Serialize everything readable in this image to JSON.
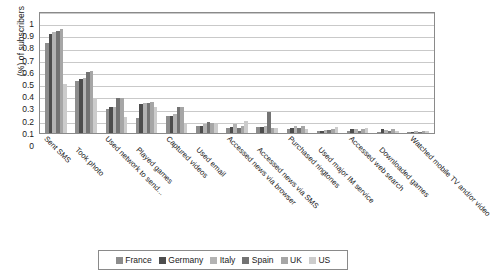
{
  "chart_data": {
    "type": "bar",
    "title": "",
    "xlabel": "",
    "ylabel": "(%) of subscribers",
    "ylim": [
      0,
      1
    ],
    "yticks": [
      "0",
      "0.1",
      "0.2",
      "0.3",
      "0.4",
      "0.5",
      "0.6",
      "0.7",
      "0.8",
      "0.9",
      "1"
    ],
    "grid": true,
    "legend_position": "bottom",
    "categories": [
      "Sent SMS",
      "Took photo",
      "Used network to send...",
      "Played games",
      "Captured videos",
      "Used email",
      "Accessed news via browser",
      "Accessed news via SMS",
      "Purchased ringtones",
      "Used major IM service",
      "Accessed web search",
      "Downloaded games",
      "Watched mobile TV and/or video"
    ],
    "series": [
      {
        "name": "France",
        "color": "#8c8c8c",
        "values": [
          0.74,
          0.43,
          0.2,
          0.12,
          0.14,
          0.06,
          0.04,
          0.05,
          0.035,
          0.015,
          0.02,
          0.01,
          0.005
        ]
      },
      {
        "name": "Germany",
        "color": "#4d4d4d",
        "values": [
          0.81,
          0.44,
          0.21,
          0.24,
          0.14,
          0.06,
          0.05,
          0.05,
          0.04,
          0.02,
          0.03,
          0.03,
          0.01
        ]
      },
      {
        "name": "Italy",
        "color": "#b3b3b3",
        "values": [
          0.83,
          0.45,
          0.21,
          0.25,
          0.155,
          0.07,
          0.07,
          0.055,
          0.055,
          0.025,
          0.035,
          0.025,
          0.015
        ]
      },
      {
        "name": "Spain",
        "color": "#737373",
        "values": [
          0.84,
          0.5,
          0.29,
          0.25,
          0.21,
          0.09,
          0.045,
          0.17,
          0.04,
          0.025,
          0.02,
          0.015,
          0.01
        ]
      },
      {
        "name": "UK",
        "color": "#a6a6a6",
        "values": [
          0.855,
          0.51,
          0.285,
          0.255,
          0.215,
          0.085,
          0.06,
          0.045,
          0.06,
          0.035,
          0.03,
          0.035,
          0.015
        ]
      },
      {
        "name": "US",
        "color": "#cccccc",
        "values": [
          0.4,
          0.285,
          0.135,
          0.21,
          0.07,
          0.075,
          0.1,
          0.04,
          0.035,
          0.05,
          0.04,
          0.02,
          0.02
        ]
      }
    ]
  },
  "legend": {
    "items": [
      {
        "label": "France"
      },
      {
        "label": "Germany"
      },
      {
        "label": "Italy"
      },
      {
        "label": "Spain"
      },
      {
        "label": "UK"
      },
      {
        "label": "US"
      }
    ]
  }
}
